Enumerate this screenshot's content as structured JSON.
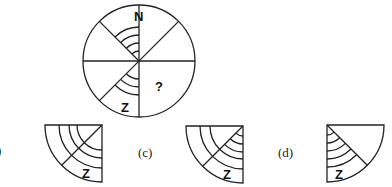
{
  "puzzle": {
    "circle": {
      "top_label": "N",
      "bottom_label": "Z",
      "missing_marker": "?"
    },
    "options": [
      {
        "label": ")",
        "visible_partial": true
      },
      {
        "label": "",
        "letter": "Z"
      },
      {
        "label": "(c)",
        "letter": "Z"
      },
      {
        "label": "(d)",
        "letter": "Z"
      }
    ]
  },
  "colors": {
    "stroke": "#222222",
    "background": "#ffffff"
  }
}
